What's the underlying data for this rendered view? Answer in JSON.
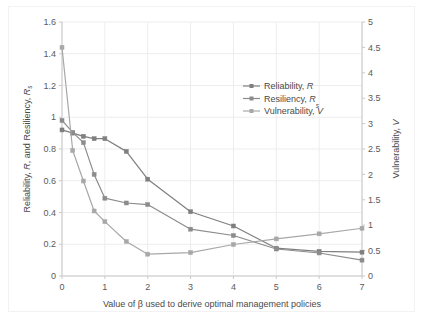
{
  "chart_data": {
    "type": "line",
    "title": "",
    "xlabel": "Value of β used to derive optimal management policies",
    "ylabel": "Reliability, R, and Resiliency, Rs",
    "y2label": "Vulnerability, V",
    "x": [
      0,
      0.25,
      0.5,
      0.75,
      1,
      1.5,
      2,
      3,
      4,
      5,
      6,
      7
    ],
    "xlim": [
      0,
      7
    ],
    "ylim": [
      0,
      1.6
    ],
    "y2lim": [
      0,
      5
    ],
    "xticks": [
      "0",
      "1",
      "2",
      "3",
      "4",
      "5",
      "6",
      "7"
    ],
    "yticks": [
      "0",
      "0.2",
      "0.4",
      "0.6",
      "0.8",
      "1",
      "1.2",
      "1.4",
      "1.6"
    ],
    "y2ticks": [
      "0",
      "0.5",
      "1",
      "1.5",
      "2",
      "2.5",
      "3",
      "3.5",
      "4",
      "4.5",
      "5"
    ],
    "grid": true,
    "legend_position": "upper right",
    "series": [
      {
        "name": "Reliability, R",
        "axis": "left",
        "color": "#7f7f7f",
        "values": [
          0.92,
          0.9,
          0.88,
          0.865,
          0.865,
          0.785,
          0.61,
          0.405,
          0.315,
          0.175,
          0.155,
          0.15
        ]
      },
      {
        "name": "Resiliency, Rs",
        "axis": "left",
        "color": "#8c8c8c",
        "values": [
          0.98,
          0.905,
          0.84,
          0.64,
          0.49,
          0.46,
          0.45,
          0.295,
          0.255,
          0.17,
          0.145,
          0.1
        ]
      },
      {
        "name": "Vulnerability, V",
        "axis": "right",
        "color": "#a8a8a8",
        "values": [
          4.5,
          2.47,
          1.87,
          1.28,
          1.07,
          0.68,
          0.43,
          0.46,
          0.62,
          0.73,
          0.83,
          0.94
        ]
      }
    ]
  },
  "legend": {
    "items": [
      {
        "label_main": "Reliability, ",
        "label_italic": "R",
        "label_sub": ""
      },
      {
        "label_main": "Resiliency, ",
        "label_italic": "R",
        "label_sub": "s"
      },
      {
        "label_main": "Vulnerability, ",
        "label_italic": "V",
        "label_sub": ""
      }
    ]
  },
  "axes": {
    "x_title": "Value of β used to derive optimal management policies",
    "y_left_title_a": "Reliability, ",
    "y_left_title_b": "R",
    "y_left_title_c": ", and Resiliency, ",
    "y_left_title_d": "R",
    "y_left_title_e": "s",
    "y_right_title_a": "Vulnerability, ",
    "y_right_title_b": "V"
  }
}
